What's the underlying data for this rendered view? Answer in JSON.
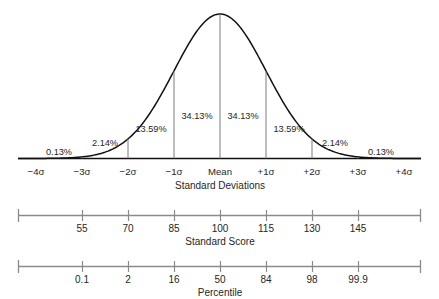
{
  "chart_data": {
    "type": "area",
    "title": "",
    "subtitle": "",
    "xlabel": "Standard Deviations",
    "ylabel": "",
    "xlim": [
      -4.35,
      4.35
    ],
    "ylim": [
      0,
      1
    ],
    "grid": false,
    "legend": null,
    "curve": {
      "name": "Normal distribution",
      "mean": 0,
      "sd": 1,
      "stroke_color": "#111111"
    },
    "band_percentages": [
      {
        "from": "-4sigma",
        "to": "-3sigma",
        "label": "0.13%",
        "value": 0.13
      },
      {
        "from": "-3sigma",
        "to": "-2sigma",
        "label": "2.14%",
        "value": 2.14
      },
      {
        "from": "-2sigma",
        "to": "-1sigma",
        "label": "13.59%",
        "value": 13.59
      },
      {
        "from": "-1sigma",
        "to": "Mean",
        "label": "34.13%",
        "value": 34.13
      },
      {
        "from": "Mean",
        "to": "+1sigma",
        "label": "34.13%",
        "value": 34.13
      },
      {
        "from": "+1sigma",
        "to": "+2sigma",
        "label": "13.59%",
        "value": 13.59
      },
      {
        "from": "+2sigma",
        "to": "+3sigma",
        "label": "2.14%",
        "value": 2.14
      },
      {
        "from": "+3sigma",
        "to": "+4sigma",
        "label": "0.13%",
        "value": 0.13
      }
    ],
    "axes": [
      {
        "name": "standard-deviations",
        "title": "Standard Deviations",
        "tick_labels": [
          "−4σ",
          "−3σ",
          "−2σ",
          "−1σ",
          "Mean",
          "+1σ",
          "+2σ",
          "+3σ",
          "+4σ"
        ],
        "tick_positions": [
          -4,
          -3,
          -2,
          -1,
          0,
          1,
          2,
          3,
          4
        ]
      },
      {
        "name": "standard-score",
        "title": "Standard Score",
        "tick_labels": [
          "55",
          "70",
          "85",
          "100",
          "115",
          "130",
          "145"
        ],
        "tick_positions": [
          -3,
          -2,
          -1,
          0,
          1,
          2,
          3
        ]
      },
      {
        "name": "percentile",
        "title": "Percentile",
        "tick_labels": [
          "0.1",
          "2",
          "16",
          "50",
          "84",
          "98",
          "99.9"
        ],
        "tick_positions": [
          -3,
          -2,
          -1,
          0,
          1,
          2,
          3
        ]
      }
    ]
  },
  "curve_band_labels": {
    "b0": "0.13%",
    "b1": "2.14%",
    "b2": "13.59%",
    "b3": "34.13%",
    "b4": "34.13%",
    "b5": "13.59%",
    "b6": "2.14%",
    "b7": "0.13%"
  },
  "sd_axis": {
    "title": "Standard Deviations",
    "t0": "−4σ",
    "t1": "−3σ",
    "t2": "−2σ",
    "t3": "−1σ",
    "t4": "Mean",
    "t5": "+1σ",
    "t6": "+2σ",
    "t7": "+3σ",
    "t8": "+4σ"
  },
  "score_axis": {
    "title": "Standard Score",
    "t0": "55",
    "t1": "70",
    "t2": "85",
    "t3": "100",
    "t4": "115",
    "t5": "130",
    "t6": "145"
  },
  "percentile_axis": {
    "title": "Percentile",
    "t0": "0.1",
    "t1": "2",
    "t2": "16",
    "t3": "50",
    "t4": "84",
    "t5": "98",
    "t6": "99.9"
  },
  "colors": {
    "curve": "#111111",
    "baseline": "#111111",
    "divider": "#7d7d7d",
    "axis": "#8a8a8a",
    "text": "#262626",
    "background": "#ffffff"
  }
}
